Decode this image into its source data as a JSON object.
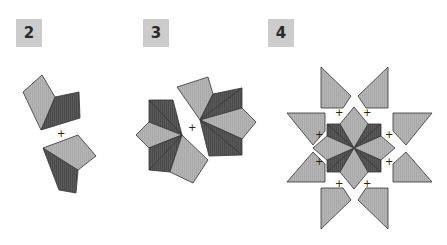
{
  "panels": [
    {
      "label": "2",
      "description": "Two kite+dart pairs rotated about a center point"
    },
    {
      "label": "3",
      "description": "Two fans of three kites and two darts each"
    },
    {
      "label": "4",
      "description": "Eight-point star with surrounding triangular pieces"
    }
  ],
  "colors": {
    "light": "#b3b3b3",
    "dark": "#555555",
    "stroke": "#333333",
    "outer": "#aaaaaa",
    "label_bg": "#cccccc"
  },
  "marker": "+"
}
